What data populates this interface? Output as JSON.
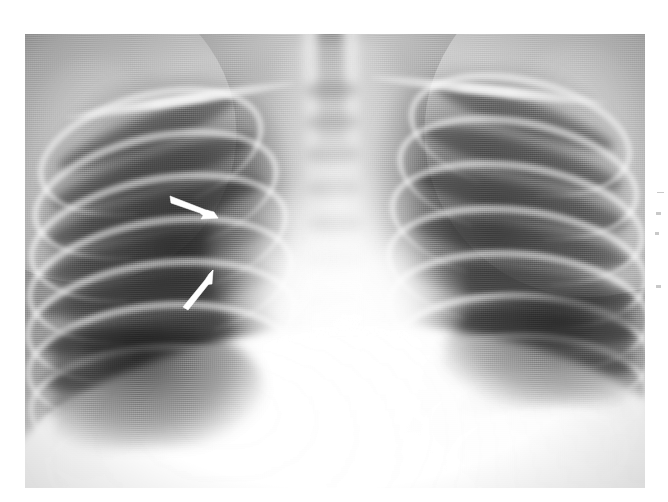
{
  "figure": {
    "kind": "chest-radiograph",
    "view": "frontal (PA) chest x-ray",
    "caption": "",
    "plate": {
      "left": 25,
      "top": 34,
      "width": 620,
      "height": 454,
      "rotation_deg": -1.15,
      "background_color": "#ffffff"
    },
    "tones": {
      "page_background": "#ffffff",
      "film_base": "#8a8a8a",
      "lung_dark": "#2d2d2d",
      "soft_tissue_mid": "#9a9a9a",
      "mediastinum_bright": "#f2f2f2",
      "diaphragm_bright": "#f7f7f7",
      "arrow_white": "#ffffff"
    },
    "anatomy": [
      {
        "name": "right-lung-field",
        "label": "Right lung field",
        "side": "viewer-left"
      },
      {
        "name": "left-lung-field",
        "label": "Left lung field",
        "side": "viewer-right"
      },
      {
        "name": "cardiac-silhouette",
        "label": "Cardiac silhouette",
        "side": "center"
      },
      {
        "name": "mediastinum",
        "label": "Mediastinum",
        "side": "center"
      },
      {
        "name": "thoracic-spine",
        "label": "Thoracic spine",
        "side": "center"
      },
      {
        "name": "trachea",
        "label": "Trachea",
        "side": "center"
      },
      {
        "name": "right-clavicle",
        "label": "Right clavicle",
        "side": "viewer-left"
      },
      {
        "name": "left-clavicle",
        "label": "Left clavicle",
        "side": "viewer-right"
      },
      {
        "name": "diaphragm",
        "label": "Diaphragm",
        "side": "inferior"
      },
      {
        "name": "right-costophrenic-angle",
        "label": "Right costophrenic angle",
        "side": "viewer-left"
      },
      {
        "name": "left-costophrenic-angle",
        "label": "Left costophrenic angle",
        "side": "viewer-right"
      }
    ],
    "ribs": {
      "right_posterior_count": 9,
      "left_posterior_count": 9
    },
    "vertebrae_visible": 7,
    "annotations": [
      {
        "name": "upper-arrow",
        "type": "arrow",
        "color": "#ffffff",
        "points_to": "right perihilar opacity",
        "tail": {
          "x": 171,
          "y": 199
        },
        "tip": {
          "x": 218,
          "y": 218
        },
        "length_px": 51,
        "angle_deg": 22
      },
      {
        "name": "lower-arrow",
        "type": "arrow",
        "color": "#ffffff",
        "points_to": "right infrahilar opacity",
        "tail": {
          "x": 185,
          "y": 306
        },
        "tip": {
          "x": 213,
          "y": 270
        },
        "length_px": 46,
        "angle_deg": -52
      }
    ],
    "margin_marks": [
      {
        "name": "margin-mark-1",
        "x": 5,
        "y": 2,
        "width": 7,
        "height": 1
      },
      {
        "name": "margin-mark-2",
        "x": 4,
        "y": 22,
        "width": 5,
        "height": 3
      },
      {
        "name": "margin-mark-3",
        "x": 3,
        "y": 42,
        "width": 4,
        "height": 3
      },
      {
        "name": "margin-mark-4",
        "x": 4,
        "y": 95,
        "width": 5,
        "height": 3
      }
    ]
  }
}
